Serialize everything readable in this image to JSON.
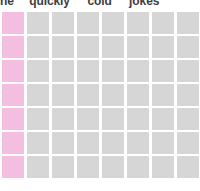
{
  "page": {
    "background_color": "#ffffff",
    "clipped_top": true
  },
  "header": {
    "words": [
      "he",
      "quickly",
      "cold",
      "jokes"
    ],
    "text": "he quickly cold jokes",
    "color": "#3d3d3d",
    "clipped": true
  },
  "grid": {
    "rows": 7,
    "columns": 8,
    "cell_width": 22,
    "cell_height": 22,
    "column_gap": 3,
    "row_gap": 2,
    "last_column_clipped": true,
    "colors": {
      "default_cell": "#d6d6d6",
      "accent_cell": "#f3bedf"
    },
    "accent_column_index": 0,
    "cells": [
      [
        "accent",
        "default",
        "default",
        "default",
        "default",
        "default",
        "default",
        "default"
      ],
      [
        "accent",
        "default",
        "default",
        "default",
        "default",
        "default",
        "default",
        "default"
      ],
      [
        "accent",
        "default",
        "default",
        "default",
        "default",
        "default",
        "default",
        "default"
      ],
      [
        "accent",
        "default",
        "default",
        "default",
        "default",
        "default",
        "default",
        "default"
      ],
      [
        "accent",
        "default",
        "default",
        "default",
        "default",
        "default",
        "default",
        "default"
      ],
      [
        "accent",
        "default",
        "default",
        "default",
        "default",
        "default",
        "default",
        "default"
      ],
      [
        "accent",
        "default",
        "default",
        "default",
        "default",
        "default",
        "default",
        "default"
      ]
    ]
  }
}
